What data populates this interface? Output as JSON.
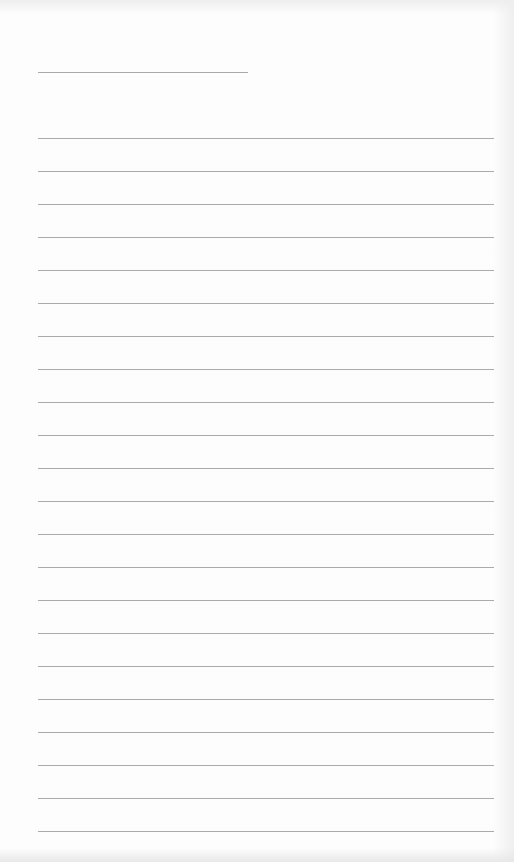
{
  "page": {
    "type": "lined-paper",
    "background_color": "#fdfdfd",
    "line_color": "#aaaaaa"
  },
  "header_line": {
    "x": 38,
    "y": 72,
    "width": 210
  },
  "rules": {
    "count": 22,
    "start_y": 138,
    "spacing": 33,
    "x": 38,
    "width": 456
  }
}
